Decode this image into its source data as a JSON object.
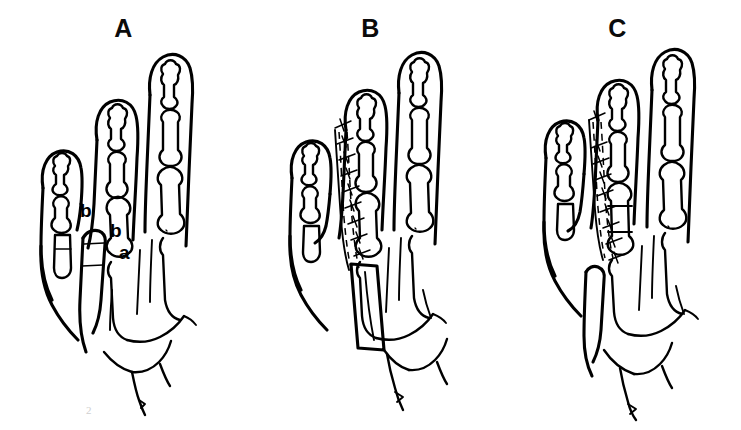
{
  "figure": {
    "background_color": "#ffffff",
    "ink_color": "#000000",
    "artifact_mark": "2",
    "panels": [
      {
        "id": "a",
        "label": "A",
        "description": "Pre-operative hand dorsum showing planned osteotomy and graft measurements",
        "annotations": [
          {
            "text": "b",
            "x": 80,
            "y": 217
          },
          {
            "text": "b",
            "x": 110,
            "y": 237
          },
          {
            "text": "a",
            "x": 119,
            "y": 259
          }
        ]
      },
      {
        "id": "b",
        "label": "B",
        "description": "Intra-operative view with sutured incision line and harvested bone graft",
        "annotations": []
      },
      {
        "id": "c",
        "label": "C",
        "description": "Post-operative result with lengthened digit and sutured closure",
        "annotations": []
      }
    ]
  }
}
